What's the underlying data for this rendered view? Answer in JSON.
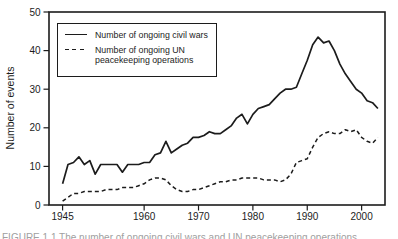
{
  "caption_fragment": "FIGURE 1.1  The number of ongoing civil wars and UN peacekeeping operations",
  "legend": {
    "items": [
      {
        "style": "solid",
        "lines": [
          "Number of ongoing civil wars"
        ]
      },
      {
        "style": "dashed",
        "lines": [
          "Number of ongoing UN",
          "peacekeeping operations"
        ]
      }
    ]
  },
  "chart_data": {
    "type": "line",
    "title": "",
    "xlabel": "",
    "ylabel": "Number of events",
    "ylim": [
      0,
      50
    ],
    "xlim": [
      1942.5,
      2004.3
    ],
    "yticks": [
      0,
      10,
      20,
      30,
      40,
      50
    ],
    "xticks": [
      1945,
      1960,
      1970,
      1980,
      1990,
      2000
    ],
    "grid": false,
    "legend_position": "top-left",
    "x": [
      1945,
      1946,
      1947,
      1948,
      1949,
      1950,
      1951,
      1952,
      1953,
      1954,
      1955,
      1956,
      1957,
      1958,
      1959,
      1960,
      1961,
      1962,
      1963,
      1964,
      1965,
      1966,
      1967,
      1968,
      1969,
      1970,
      1971,
      1972,
      1973,
      1974,
      1975,
      1976,
      1977,
      1978,
      1979,
      1980,
      1981,
      1982,
      1983,
      1984,
      1985,
      1986,
      1987,
      1988,
      1989,
      1990,
      1991,
      1992,
      1993,
      1994,
      1995,
      1996,
      1997,
      1998,
      1999,
      2000,
      2001,
      2002,
      2003
    ],
    "series": [
      {
        "name": "Number of ongoing civil wars",
        "style": "solid",
        "values": [
          5.5,
          10.5,
          11,
          12.5,
          10.5,
          11.5,
          8,
          10.5,
          10.5,
          10.5,
          10.5,
          8.5,
          10.5,
          10.5,
          10.5,
          11,
          11,
          13,
          13.5,
          16.5,
          13.5,
          14.5,
          15.5,
          16,
          17.5,
          17.5,
          18,
          19,
          18.5,
          18.5,
          19.5,
          20.5,
          22.5,
          23.5,
          21,
          23.5,
          25,
          25.5,
          26,
          27.5,
          29,
          30,
          30,
          30.5,
          34,
          37.5,
          41.5,
          43.5,
          42,
          42.5,
          40,
          36.5,
          34,
          32,
          30,
          29,
          27,
          26.5,
          25
        ]
      },
      {
        "name": "Number of ongoing UN peacekeeping operations",
        "style": "dashed",
        "values": [
          1,
          2,
          3,
          3,
          3.5,
          3.5,
          3.5,
          3.5,
          4,
          4,
          4,
          4.5,
          4.5,
          4.5,
          5,
          5.5,
          6.5,
          7,
          7,
          6.5,
          5,
          4,
          3.5,
          3.5,
          4,
          4,
          4.5,
          5,
          5.5,
          6,
          6,
          6.5,
          6.5,
          7,
          7,
          7,
          7,
          6.5,
          6.5,
          6.5,
          6,
          6.5,
          8,
          11,
          11.5,
          12,
          15,
          17.5,
          18.5,
          19,
          18.5,
          18.5,
          19.5,
          19,
          19.5,
          17.5,
          16.5,
          16,
          17.5
        ]
      }
    ]
  }
}
